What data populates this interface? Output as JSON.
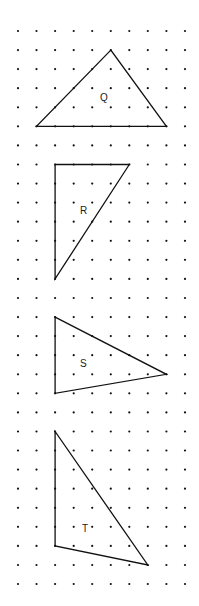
{
  "grid": {
    "cols": 10,
    "rows": 30,
    "x0": 18,
    "y0": 31,
    "dx": 18.55,
    "dy": 19.07,
    "dot_radius": 1.1,
    "dot_color": "#111111"
  },
  "shapes": [
    {
      "label": "Q",
      "points": [
        [
          5,
          1
        ],
        [
          1,
          5
        ],
        [
          8,
          5
        ]
      ],
      "label_pos": [
        100,
        101
      ]
    },
    {
      "label": "R",
      "points": [
        [
          2,
          7
        ],
        [
          6,
          7
        ],
        [
          2,
          13
        ]
      ],
      "label_pos": [
        80,
        214
      ]
    },
    {
      "label": "S",
      "points": [
        [
          2,
          15
        ],
        [
          2,
          19
        ],
        [
          8,
          18
        ]
      ],
      "label_pos": [
        80,
        367
      ]
    },
    {
      "label": "T",
      "points": [
        [
          2,
          21
        ],
        [
          2,
          27
        ],
        [
          7,
          28
        ]
      ],
      "label_pos": [
        82,
        532
      ]
    }
  ],
  "line_color": "#111111"
}
